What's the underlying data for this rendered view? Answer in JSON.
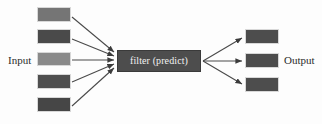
{
  "diagram": {
    "background_color": "#fdfdfd",
    "labels": {
      "input": "Input",
      "output": "Output"
    },
    "filter": {
      "text": "filter (predict)",
      "fill": "#4d4d4d",
      "text_color": "#f2f2f2",
      "x": 117,
      "y": 50,
      "width": 84,
      "height": 22
    },
    "input_nodes": [
      {
        "id": "input-node-1",
        "fill": "#757575",
        "x": 37,
        "y": 7,
        "width": 34,
        "height": 15
      },
      {
        "id": "input-node-2",
        "fill": "#4a4a4a",
        "x": 37,
        "y": 29,
        "width": 34,
        "height": 15
      },
      {
        "id": "input-node-3",
        "fill": "#8a8a8a",
        "x": 37,
        "y": 52,
        "width": 34,
        "height": 14
      },
      {
        "id": "input-node-4",
        "fill": "#4f4f4f",
        "x": 37,
        "y": 74,
        "width": 34,
        "height": 15
      },
      {
        "id": "input-node-5",
        "fill": "#464646",
        "x": 37,
        "y": 97,
        "width": 34,
        "height": 15
      }
    ],
    "output_nodes": [
      {
        "id": "output-node-1",
        "fill": "#4d4d4d",
        "x": 245,
        "y": 29,
        "width": 34,
        "height": 15
      },
      {
        "id": "output-node-2",
        "fill": "#4d4d4d",
        "x": 245,
        "y": 53,
        "width": 34,
        "height": 15
      },
      {
        "id": "output-node-3",
        "fill": "#4d4d4d",
        "x": 245,
        "y": 77,
        "width": 34,
        "height": 15
      }
    ],
    "input_arrows": [
      {
        "id": "arrow-in-1",
        "x1": 72,
        "y1": 17,
        "x2": 114,
        "y2": 52
      },
      {
        "id": "arrow-in-2",
        "x1": 72,
        "y1": 39,
        "x2": 114,
        "y2": 56
      },
      {
        "id": "arrow-in-3",
        "x1": 72,
        "y1": 60,
        "x2": 114,
        "y2": 60
      },
      {
        "id": "arrow-in-4",
        "x1": 72,
        "y1": 82,
        "x2": 114,
        "y2": 64
      },
      {
        "id": "arrow-in-5",
        "x1": 72,
        "y1": 106,
        "x2": 114,
        "y2": 68
      }
    ],
    "output_arrows": [
      {
        "id": "arrow-out-1",
        "x1": 203,
        "y1": 61,
        "x2": 242,
        "y2": 38
      },
      {
        "id": "arrow-out-2",
        "x1": 203,
        "y1": 61,
        "x2": 242,
        "y2": 61
      },
      {
        "id": "arrow-out-3",
        "x1": 203,
        "y1": 61,
        "x2": 242,
        "y2": 84
      }
    ],
    "label_positions": {
      "input": {
        "x": 8,
        "y": 55
      },
      "output": {
        "x": 284,
        "y": 55
      }
    },
    "line_color": "#4a4a4a"
  }
}
